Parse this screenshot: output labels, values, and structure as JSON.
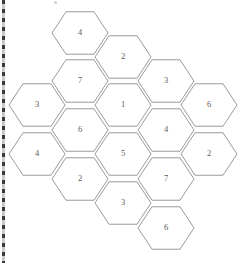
{
  "page": {
    "background_color": "#ffffff",
    "width": 247,
    "height": 263
  },
  "artifacts": {
    "scan_edge": {
      "name": "dashed-scan-edge",
      "color_dark": "#3a3a3a",
      "color_light": "#c9c9c9"
    },
    "speck": {
      "name": "scan-speck",
      "color": "#d0d0d0"
    }
  },
  "hex_grid": {
    "style": {
      "stroke_color": "#8e8e8e",
      "fill_color": "#ffffff",
      "label_color": "#5a5a5a",
      "radius": 28,
      "orientation": "flat-top"
    },
    "columns": [
      {
        "name": "column-1",
        "cx": 37,
        "cells": [
          {
            "label": "3",
            "cy": 105
          },
          {
            "label": "4",
            "cy": 154
          }
        ]
      },
      {
        "name": "column-2",
        "cx": 80,
        "cells": [
          {
            "label": "4",
            "cy": 33
          },
          {
            "label": "7",
            "cy": 81
          },
          {
            "label": "6",
            "cy": 130
          },
          {
            "label": "2",
            "cy": 179
          }
        ]
      },
      {
        "name": "column-3",
        "cx": 123,
        "cells": [
          {
            "label": "2",
            "cy": 57
          },
          {
            "label": "1",
            "cy": 105
          },
          {
            "label": "5",
            "cy": 154
          },
          {
            "label": "3",
            "cy": 203
          }
        ]
      },
      {
        "name": "column-4",
        "cx": 166,
        "cells": [
          {
            "label": "3",
            "cy": 81
          },
          {
            "label": "4",
            "cy": 130
          },
          {
            "label": "7",
            "cy": 179
          },
          {
            "label": "6",
            "cy": 228
          }
        ]
      },
      {
        "name": "column-5",
        "cx": 209,
        "cells": [
          {
            "label": "6",
            "cy": 105
          },
          {
            "label": "2",
            "cy": 154
          }
        ]
      }
    ]
  }
}
